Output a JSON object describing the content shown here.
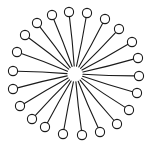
{
  "diagram": {
    "type": "micelle",
    "background": "#ffffff",
    "stroke_color": "#1a1a1a",
    "head_fill": "#ffffff",
    "center": [
      75,
      74
    ],
    "inner_radius": 8,
    "head_radius": 4.6,
    "molecule_count": 22,
    "heads": [
      [
        52,
        15
      ],
      [
        69,
        12
      ],
      [
        87,
        13
      ],
      [
        105,
        19
      ],
      [
        119,
        29
      ],
      [
        132,
        42
      ],
      [
        138,
        58
      ],
      [
        139,
        76
      ],
      [
        137,
        93
      ],
      [
        129,
        110
      ],
      [
        117,
        124
      ],
      [
        100,
        132
      ],
      [
        82,
        135
      ],
      [
        63,
        134
      ],
      [
        45,
        127
      ],
      [
        32,
        119
      ],
      [
        20,
        106
      ],
      [
        13,
        89
      ],
      [
        13,
        71
      ],
      [
        17,
        52
      ],
      [
        25,
        35
      ],
      [
        37,
        23
      ]
    ]
  }
}
